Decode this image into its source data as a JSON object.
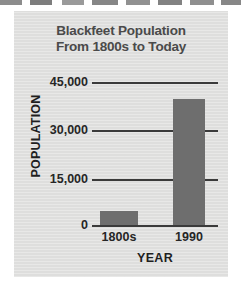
{
  "chart_data": {
    "type": "bar",
    "title": "Blackfeet Population From 1800s to Today",
    "title_lines": [
      "Blackfeet Population",
      "From 1800s to Today"
    ],
    "categories": [
      "1800s",
      "1990"
    ],
    "values": [
      4500,
      39500
    ],
    "xlabel": "YEAR",
    "ylabel": "POPULATION",
    "ylim": [
      0,
      45000
    ],
    "yticks": [
      "0",
      "15,000",
      "30,000",
      "45,000"
    ],
    "ytick_values": [
      0,
      15000,
      30000,
      45000
    ],
    "grid": true,
    "legend": "none",
    "colors": {
      "bar": "#6e6e6e",
      "panel": "#dededd",
      "title_text": "#4a4a4a",
      "axis_text": "#262626",
      "gridline": "#3a3a3a"
    }
  }
}
